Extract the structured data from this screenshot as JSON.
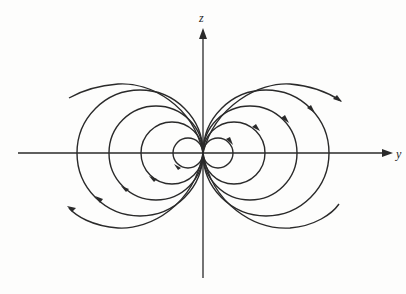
{
  "figure": {
    "axes": {
      "horizontal_label": "y",
      "vertical_label": "z"
    },
    "origin": [
      203,
      153
    ],
    "loop_radii": [
      15,
      31,
      47,
      63
    ],
    "colors": {
      "background": "#fdfdfc",
      "ink": "#2a2a2a"
    }
  }
}
